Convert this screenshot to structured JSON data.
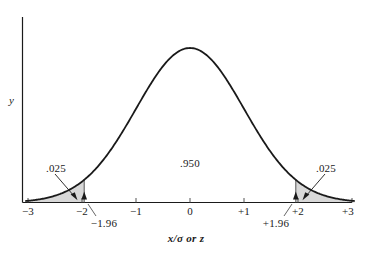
{
  "figure": {
    "background_color": "#ffffff",
    "line_color": "#1a1a1a",
    "shade_color": "#d8d8d8",
    "axis_y_label": "y",
    "x_caption": "x/σ or z"
  },
  "labels": {
    "center_area": ".950",
    "left_tail_area": ".025",
    "right_tail_area": ".025",
    "left_bound": "−1.96",
    "right_bound": "+1.96"
  },
  "chart_data": {
    "type": "area",
    "title": "",
    "subtitle": "",
    "xlabel": "x/σ or z",
    "ylabel": "y",
    "curve": "standard normal density",
    "xlim": [
      -3.05,
      3.05
    ],
    "ylim": [
      0,
      0.41
    ],
    "grid": false,
    "legend": null,
    "x_ticks": [
      -3,
      -2,
      -1,
      0,
      1,
      2,
      3
    ],
    "x_tick_labels": [
      "−3",
      "−2",
      "−1",
      "0",
      "+1",
      "+2",
      "+3"
    ],
    "y_ticks": [],
    "y_tick_labels": [],
    "critical_values": [
      -1.96,
      1.96
    ],
    "critical_value_labels": [
      "−1.96",
      "+1.96"
    ],
    "regions": [
      {
        "name": "left tail",
        "from": -3.05,
        "to": -1.96,
        "area": 0.025,
        "label": ".025",
        "shaded": true
      },
      {
        "name": "central",
        "from": -1.96,
        "to": 1.96,
        "area": 0.95,
        "label": ".950",
        "shaded": false
      },
      {
        "name": "right tail",
        "from": 1.96,
        "to": 3.05,
        "area": 0.025,
        "label": ".025",
        "shaded": true
      }
    ],
    "annotations": [
      {
        "text": ".025",
        "target_x": -2.25,
        "kind": "leader-arrow"
      },
      {
        "text": ".950",
        "target_x": 0.0,
        "kind": "text"
      },
      {
        "text": ".025",
        "target_x": 2.25,
        "kind": "leader-arrow"
      }
    ]
  }
}
